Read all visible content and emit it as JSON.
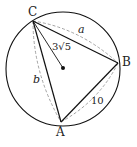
{
  "diagram": {
    "circle": {
      "cx": 63,
      "cy": 69,
      "r": 57
    },
    "center_dot": {
      "x": 63,
      "y": 68
    },
    "points": {
      "C": {
        "x": 33,
        "y": 21,
        "label": "C",
        "lx": 28,
        "ly": 16
      },
      "B": {
        "x": 118,
        "y": 63,
        "label": "B",
        "lx": 122,
        "ly": 66
      },
      "A": {
        "x": 61,
        "y": 122,
        "label": "A",
        "lx": 56,
        "ly": 136
      }
    },
    "labels": {
      "a": {
        "text": "a",
        "x": 78,
        "y": 33
      },
      "b": {
        "text": "b",
        "x": 33,
        "y": 83
      },
      "side_AB": {
        "text": "10",
        "x": 91,
        "y": 104
      },
      "radius": {
        "text": "3√5",
        "x": 52,
        "y": 50
      }
    },
    "colors": {
      "stroke": "#111111",
      "dashed": "#999999"
    }
  }
}
